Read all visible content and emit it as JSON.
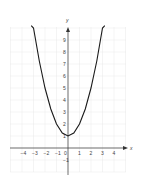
{
  "chart_data": {
    "type": "line",
    "title": "",
    "xlabel": "x",
    "ylabel": "y",
    "xlim": [
      -5,
      5
    ],
    "ylim": [
      -2,
      10
    ],
    "grid": true,
    "legend": null,
    "x_ticks": [
      "-4",
      "-3",
      "-2",
      "-1",
      "0",
      "1",
      "2",
      "3",
      "4"
    ],
    "y_ticks": [
      "-1",
      "1",
      "2",
      "3",
      "4",
      "5",
      "6",
      "7",
      "8",
      "9"
    ],
    "series": [
      {
        "name": "parabola",
        "equation": "y = x^2 + 1",
        "x": [
          -3.2,
          -3,
          -2.5,
          -2,
          -1.5,
          -1,
          -0.5,
          0,
          0.5,
          1,
          1.5,
          2,
          2.5,
          3,
          3.2
        ],
        "y": [
          10.2,
          10,
          7.25,
          5,
          3.25,
          2,
          1.25,
          1,
          1.25,
          2,
          3.25,
          5,
          7.25,
          10,
          10.2
        ]
      }
    ],
    "vertex": [
      0,
      1
    ],
    "colors": {
      "curve": "#1a1a1a",
      "axis": "#333333",
      "grid": "#e6e6e6"
    }
  }
}
